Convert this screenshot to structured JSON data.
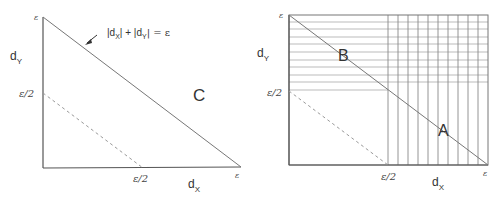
{
  "panels": [
    {
      "id": "left",
      "axis_x_label": "d",
      "axis_x_sub": "X",
      "axis_y_label": "d",
      "axis_y_sub": "Y",
      "tick_y_top": "ε",
      "tick_y_half": "ε/2",
      "tick_x_half": "ε/2",
      "tick_x_end": "ε",
      "region_label": "C",
      "annotation": {
        "text_a": "|d",
        "sub_a": "X",
        "text_b": "| + |d",
        "sub_b": "Y",
        "text_c": "| = ε"
      }
    },
    {
      "id": "right",
      "axis_x_label": "d",
      "axis_x_sub": "X",
      "axis_y_label": "d",
      "axis_y_sub": "Y",
      "tick_y_top": "ε",
      "tick_y_half": "ε/2",
      "tick_x_half": "ε/2",
      "tick_x_end": "ε",
      "region_labels": [
        "B",
        "A"
      ]
    }
  ],
  "colors": {
    "axis": "#555555",
    "line": "#777777",
    "dashed": "#999999",
    "grid": "#aaaaaa",
    "text": "#333333"
  }
}
